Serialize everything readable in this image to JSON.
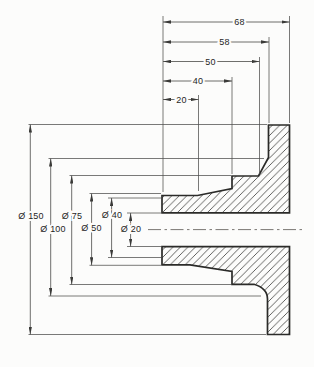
{
  "drawing_title": "",
  "colors": {
    "background": "#fcfcfb",
    "part_outline": "#2b2b29",
    "hatching": "#454543",
    "dimension_lines": "#4e4e4c",
    "text": "#1f1f1f"
  },
  "dims": {
    "lengths": [
      {
        "label": "68",
        "value": 68
      },
      {
        "label": "58",
        "value": 58
      },
      {
        "label": "50",
        "value": 50
      },
      {
        "label": "40",
        "value": 40
      },
      {
        "label": "20",
        "value": 20
      }
    ],
    "diameters": [
      {
        "label": "Ø 150",
        "value": 150
      },
      {
        "label": "Ø 100",
        "value": 100
      },
      {
        "label": "Ø 75",
        "value": 75
      },
      {
        "label": "Ø 50",
        "value": 50
      },
      {
        "label": "Ø 40",
        "value": 40
      },
      {
        "label": "Ø 20",
        "value": 20
      }
    ]
  }
}
